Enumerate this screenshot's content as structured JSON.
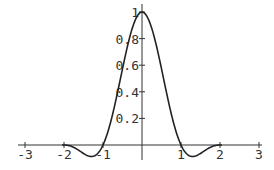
{
  "chart_data": {
    "type": "line",
    "title": "",
    "xlabel": "",
    "ylabel": "",
    "xlim": [
      -3.3,
      3.2
    ],
    "ylim": [
      -0.2,
      1.0
    ],
    "grid": false,
    "legend": null,
    "x_ticks": [
      -3,
      -2,
      -1,
      1,
      2,
      3
    ],
    "x_tick_labels": [
      "-3",
      "-2",
      "-1",
      "1",
      "2",
      "3"
    ],
    "y_ticks": [
      0.2,
      0.4,
      0.6,
      0.8,
      1
    ],
    "y_tick_labels": [
      "0.2",
      "0.4",
      "0.6",
      "0.8",
      "1"
    ],
    "series": [
      {
        "name": "L(x) = sinc(x)·sinc(x/2), |x|<2",
        "x": [
          -3,
          -2,
          -1.5,
          -1.2,
          -1,
          -0.75,
          -0.5,
          -0.25,
          0,
          0.25,
          0.5,
          0.75,
          1,
          1.2,
          1.5,
          2,
          3
        ],
        "y": [
          0,
          0,
          -0.064,
          -0.136,
          0,
          0.27,
          0.573,
          0.85,
          1.0,
          0.85,
          0.573,
          0.27,
          0,
          -0.136,
          -0.064,
          0,
          0
        ]
      }
    ],
    "colors": {
      "line": "#222222",
      "axes": "#333333"
    }
  }
}
